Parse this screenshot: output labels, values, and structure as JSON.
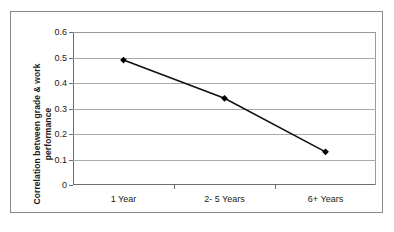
{
  "chart_data": {
    "type": "line",
    "title": "",
    "xlabel": "",
    "ylabel": "Correlation between grade & work performance",
    "ylabel_line1": "Correlation between grade & work",
    "ylabel_line2": "performance",
    "categories": [
      "1 Year",
      "2- 5 Years",
      "6+ Years"
    ],
    "values": [
      0.49,
      0.34,
      0.13
    ],
    "series": [
      {
        "name": "Correlation between grade & work performance",
        "values": [
          0.49,
          0.34,
          0.13
        ]
      }
    ],
    "ylim": [
      0,
      0.6
    ],
    "ytick_labels": [
      "0",
      "0.1",
      "0.2",
      "0.3",
      "0.4",
      "0.5",
      "0.6"
    ],
    "ytick_values": [
      0,
      0.1,
      0.2,
      0.3,
      0.4,
      0.5,
      0.6
    ],
    "grid": true,
    "grid_axis": "y",
    "legend": false,
    "legend_position": "none",
    "marker": "diamond",
    "line_color": "#111111",
    "marker_color": "#000000",
    "grid_color": "#a9a9a9",
    "axis_color": "#6e6e6e",
    "background_color": "#ffffff",
    "frame_color": "#8a8a8a"
  }
}
